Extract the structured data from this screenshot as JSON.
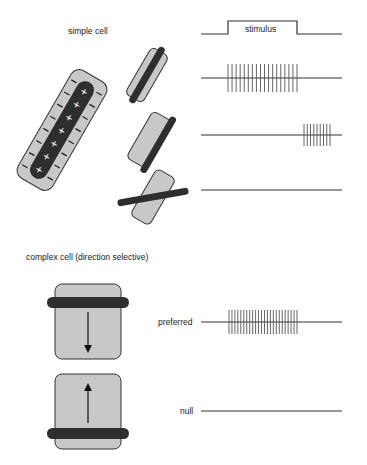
{
  "simple_cell": {
    "title": "simple cell",
    "stimulus_label": "stimulus",
    "receptive_field": {
      "center_sign": "+",
      "surround_sign": "−",
      "center_count": 7
    },
    "responses": [
      {
        "orientation": "aligned on center",
        "spikes": 18
      },
      {
        "orientation": "offset to edge",
        "spikes": 9
      },
      {
        "orientation": "orthogonal",
        "spikes": 0
      }
    ]
  },
  "complex_cell": {
    "title": "complex cell (direction selective)",
    "conditions": [
      {
        "label": "preferred",
        "motion": "down",
        "spikes": 24
      },
      {
        "label": "null",
        "motion": "up",
        "spikes": 0
      }
    ]
  },
  "colors": {
    "field_fill": "#c8c8c8",
    "bar": "#2e2e2e",
    "line": "#333333"
  }
}
